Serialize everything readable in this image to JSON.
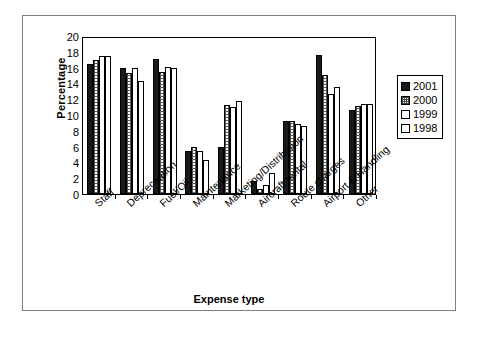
{
  "chart_data": {
    "type": "bar",
    "title": "",
    "xlabel": "Expense type",
    "ylabel": "Percentage",
    "ylim": [
      0,
      20
    ],
    "yticks": [
      0,
      2,
      4,
      6,
      8,
      10,
      12,
      14,
      16,
      18,
      20
    ],
    "grid": false,
    "legend_position": "right",
    "categories": [
      "Staff",
      "Depreceation",
      "Fuel/Oil",
      "Maintenance",
      "Marketing/Distribution",
      "Aircraft rental",
      "Route charges",
      "Airport & Handling",
      "Other"
    ],
    "series": [
      {
        "name": "2001",
        "values": [
          16.4,
          15.9,
          17.1,
          5.5,
          6.0,
          1.7,
          9.3,
          17.6,
          10.6
        ]
      },
      {
        "name": "2000",
        "values": [
          17.0,
          15.3,
          15.5,
          5.9,
          11.3,
          0.6,
          9.2,
          15.1,
          11.1
        ]
      },
      {
        "name": "1999",
        "values": [
          17.5,
          15.9,
          16.1,
          5.4,
          11.0,
          1.2,
          8.9,
          12.7,
          11.4
        ]
      },
      {
        "name": "1998",
        "values": [
          17.5,
          14.3,
          16.0,
          4.3,
          11.8,
          2.6,
          8.6,
          13.6,
          11.4
        ]
      }
    ]
  },
  "legend": {
    "items": [
      {
        "label": "2001",
        "color": "#1a1a1a"
      },
      {
        "label": "2000",
        "color": "#bfbfbf"
      },
      {
        "label": "1999",
        "color": "#ffffff"
      },
      {
        "label": "1998",
        "color": "#ffffff"
      }
    ]
  },
  "colors": {
    "axis": "#000000",
    "frame": "#808080",
    "background": "#ffffff"
  }
}
